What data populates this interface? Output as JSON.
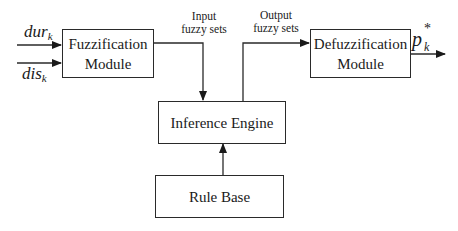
{
  "diagram": {
    "inputs": [
      {
        "name": "dur",
        "subscript": "k"
      },
      {
        "name": "dis",
        "subscript": "k"
      }
    ],
    "output": {
      "name": "p",
      "subscript": "k",
      "superscript": "*"
    },
    "blocks": {
      "fuzzification": {
        "line1": "Fuzzification",
        "line2": "Module"
      },
      "defuzzification": {
        "line1": "Defuzzification",
        "line2": "Module"
      },
      "inference": {
        "label": "Inference Engine"
      },
      "rulebase": {
        "label": "Rule Base"
      }
    },
    "edge_labels": {
      "input_sets": {
        "line1": "Input",
        "line2": "fuzzy sets"
      },
      "output_sets": {
        "line1": "Output",
        "line2": "fuzzy sets"
      }
    },
    "colors": {
      "stroke": "#2a2a2a",
      "background": "#ffffff"
    }
  }
}
